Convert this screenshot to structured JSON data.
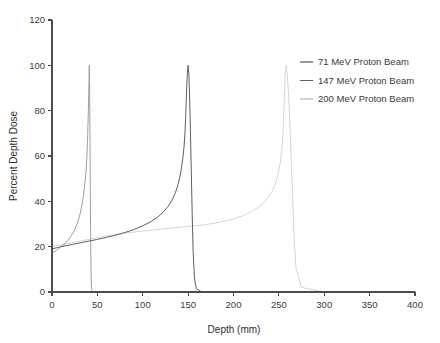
{
  "chart_data": {
    "type": "line",
    "title": "",
    "xlabel": "Depth (mm)",
    "ylabel": "Percent Depth Dose",
    "xlim": [
      0,
      400
    ],
    "ylim": [
      0,
      120
    ],
    "xticks": [
      0,
      50,
      100,
      150,
      200,
      250,
      300,
      350,
      400
    ],
    "yticks": [
      0,
      20,
      40,
      60,
      80,
      100,
      120
    ],
    "grid": false,
    "legend_position": "upper right",
    "background": "#ffffff",
    "series": [
      {
        "name": "71 MeV Proton Beam",
        "color": "#9a9a9a",
        "peak_depth_mm": 41,
        "peak_value": 100,
        "entrance_dose": 17,
        "distal_end_mm": 43,
        "x": [
          0,
          2,
          5,
          8,
          12,
          16,
          20,
          24,
          28,
          31,
          34,
          36,
          37.5,
          38.5,
          39.3,
          40,
          40.5,
          40.9,
          41.1,
          41.4,
          41.8,
          42.2,
          42.6,
          43,
          43.4,
          44,
          45,
          60,
          120,
          200,
          300,
          400
        ],
        "y": [
          17,
          17.6,
          18.4,
          19.3,
          20.6,
          22.1,
          24,
          26.6,
          30.4,
          34.5,
          40.5,
          47,
          53,
          60,
          69,
          79,
          88,
          96,
          100,
          93,
          72,
          45,
          22,
          8,
          2.5,
          0.6,
          0,
          0,
          0,
          0,
          0,
          0
        ]
      },
      {
        "name": "147 MeV Proton Beam",
        "color": "#5f5f5f",
        "peak_depth_mm": 148,
        "peak_value": 100,
        "entrance_dose": 19,
        "distal_end_mm": 157,
        "x": [
          0,
          5,
          10,
          20,
          30,
          40,
          50,
          60,
          70,
          80,
          90,
          100,
          108,
          116,
          122,
          128,
          132,
          136,
          139,
          142,
          144,
          145.5,
          146.5,
          147.3,
          148,
          148.6,
          149.2,
          150,
          150.8,
          151.6,
          152.5,
          153.5,
          154.5,
          155.5,
          157,
          159,
          165,
          200,
          300,
          400
        ],
        "y": [
          19,
          19.5,
          20,
          20.8,
          21.6,
          22.4,
          23.2,
          24.1,
          25.1,
          26.2,
          27.5,
          29.2,
          30.8,
          32.9,
          35,
          37.8,
          40.3,
          43.8,
          47.5,
          53,
          58.5,
          64,
          70,
          77,
          85,
          92,
          97,
          100,
          96,
          87,
          72,
          53,
          34,
          18,
          6,
          1.5,
          0,
          0,
          0,
          0
        ]
      },
      {
        "name": "200 MeV Proton Beam",
        "color": "#d2d2d2",
        "peak_depth_mm": 256,
        "peak_value": 100,
        "entrance_dose": 20,
        "distal_end_mm": 267,
        "x": [
          0,
          5,
          10,
          20,
          30,
          40,
          50,
          60,
          70,
          80,
          90,
          100,
          110,
          120,
          130,
          140,
          150,
          160,
          170,
          180,
          190,
          200,
          210,
          218,
          226,
          232,
          238,
          242,
          246,
          249,
          251.5,
          253.5,
          255,
          256,
          257,
          258,
          259.5,
          261,
          262.5,
          264,
          265.5,
          267,
          269,
          275,
          300,
          350,
          400
        ],
        "y": [
          20,
          20.4,
          20.8,
          21.6,
          22.4,
          23.2,
          24,
          24.7,
          25.3,
          25.9,
          26.4,
          26.9,
          27.3,
          27.7,
          28.1,
          28.5,
          28.9,
          29.3,
          29.8,
          30.4,
          31.2,
          32.2,
          33.6,
          35,
          37,
          39,
          41.5,
          44,
          47.5,
          52,
          57,
          64,
          74,
          86,
          96,
          100,
          95,
          84,
          70,
          54,
          38,
          22,
          10,
          2,
          0,
          0,
          0
        ]
      }
    ]
  },
  "legend": {
    "items": [
      {
        "label": "71 MeV Proton Beam",
        "color": "#9a9a9a"
      },
      {
        "label": "147 MeV Proton Beam",
        "color": "#5f5f5f"
      },
      {
        "label": "200 MeV Proton Beam",
        "color": "#d2d2d2"
      }
    ]
  },
  "axes": {
    "x_title": "Depth (mm)",
    "y_title": "Percent Depth Dose",
    "x_tick_labels": [
      "0",
      "50",
      "100",
      "150",
      "200",
      "250",
      "300",
      "350",
      "400"
    ],
    "y_tick_labels": [
      "0",
      "20",
      "40",
      "60",
      "80",
      "100",
      "120"
    ]
  }
}
